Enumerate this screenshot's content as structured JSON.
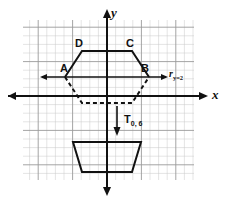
{
  "figure": {
    "kind": "coordinate-plane-transformation-diagram",
    "background_color": "#ffffff",
    "ink_color": "#111111",
    "grid_minor_color": "#c9c9c9",
    "grid_major_color": "#9a9a9a"
  },
  "axes": {
    "x_label": "x",
    "y_label": "y",
    "x_axis_pixel_y": 96,
    "y_axis_pixel_x": 107,
    "cell_size_px": 8.6
  },
  "grid": {
    "left_px": 23,
    "top_px": 20,
    "right_px": 194,
    "bottom_px": 180,
    "minor_cols": 20,
    "minor_rows": 19,
    "major_every": 4
  },
  "labels": {
    "vertex_a": "A",
    "vertex_b": "B",
    "vertex_c": "C",
    "vertex_d": "D",
    "reflection_prefix": "r",
    "reflection_subscript": "y=2",
    "translation_prefix": "T",
    "translation_subscript": "0, 6"
  },
  "shapes": {
    "preimage": {
      "name": "solid-hexagon-preimage",
      "points": "65,77 82,51 132,51 149,77",
      "closed": false,
      "style": "solid",
      "vertices": [
        {
          "label": "A",
          "x": 65,
          "y": 77
        },
        {
          "label": "D",
          "x": 82,
          "y": 51
        },
        {
          "label": "C",
          "x": 132,
          "y": 51
        },
        {
          "label": "B",
          "x": 149,
          "y": 77
        }
      ]
    },
    "reflected_image": {
      "name": "dashed-trapezoid-reflection",
      "points": "65,77 82,103 132,103 149,77",
      "closed": false,
      "style": "dashed"
    },
    "translated_image": {
      "name": "solid-trapezoid-translation",
      "points": "73,142 141,142 132,172 82,172",
      "closed": true,
      "style": "solid"
    }
  },
  "annotations": {
    "reflection_line": {
      "name": "reflection-line-y-equals-2",
      "from_x": 42,
      "to_x": 166,
      "y": 77,
      "arrow_left": true,
      "arrow_right": true
    },
    "translation_vector": {
      "name": "translation-arrow-down",
      "x": 117,
      "from_y": 106,
      "to_y": 134,
      "arrow_end": "down"
    }
  }
}
